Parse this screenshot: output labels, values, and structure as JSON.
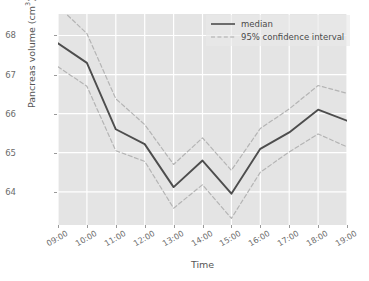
{
  "chart_data": {
    "type": "line",
    "title": "",
    "xlabel": "Time",
    "ylabel": "Pancreas volume (cm³)",
    "ylabel_text": "Pancreas volume (cm",
    "ylabel_sup": "3",
    "ylabel_tail": ")",
    "categories": [
      "09:00",
      "10:00",
      "11:00",
      "12:00",
      "13:00",
      "14:00",
      "15:00",
      "16:00",
      "17:00",
      "18:00",
      "19:00"
    ],
    "x": [
      "09:00",
      "10:00",
      "11:00",
      "12:00",
      "13:00",
      "14:00",
      "15:00",
      "16:00",
      "17:00",
      "18:00",
      "19:00"
    ],
    "yticks": [
      64,
      65,
      66,
      67,
      68
    ],
    "ytick_labels": [
      "64",
      "65",
      "66",
      "67",
      "68"
    ],
    "ylim": [
      63.15,
      68.55
    ],
    "grid": true,
    "legend_position": "top-right",
    "series": [
      {
        "name": "median",
        "style": "solid",
        "color": "#4d4d4d",
        "values": [
          67.8,
          67.3,
          65.6,
          65.22,
          64.12,
          64.8,
          63.95,
          65.1,
          65.52,
          66.1,
          65.82
        ]
      },
      {
        "name": "95% confidence interval upper",
        "style": "dashed",
        "color": "#b4b4b4",
        "values": [
          68.75,
          68.05,
          66.38,
          65.72,
          64.7,
          65.38,
          64.55,
          65.62,
          66.12,
          66.72,
          66.52
        ]
      },
      {
        "name": "95% confidence interval lower",
        "style": "dashed",
        "color": "#b4b4b4",
        "values": [
          67.2,
          66.7,
          65.05,
          64.78,
          63.58,
          64.18,
          63.32,
          64.5,
          65.02,
          65.48,
          65.15
        ]
      }
    ],
    "legend": [
      {
        "label": "median",
        "style": "solid",
        "color": "#4d4d4d"
      },
      {
        "label": "95% confidence interval",
        "style": "dashed",
        "color": "#b4b4b4"
      }
    ],
    "colors": {
      "plot_background": "#e4e4e4",
      "figure_background": "#ffffff",
      "gridline": "#ffffff",
      "median_line": "#4d4d4d",
      "confidence_line": "#b4b4b4",
      "tick_text": "#6b6b6b",
      "axis_label_text": "#555555"
    }
  }
}
